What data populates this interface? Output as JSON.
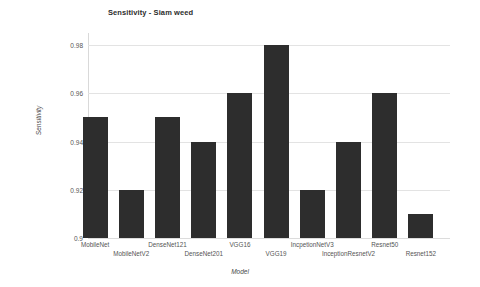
{
  "chart_data": {
    "type": "bar",
    "title": "Sensitivity - Siam weed",
    "xlabel": "Model",
    "ylabel": "Sensitivity",
    "categories": [
      "MobileNet",
      "MobileNetV2",
      "DenseNet121",
      "DenseNet201",
      "VGG16",
      "VGG19",
      "IncpetionNetV3",
      "InceptionResnetV2",
      "Resnet50",
      "Resnet152"
    ],
    "values": [
      0.95,
      0.92,
      0.95,
      0.94,
      0.96,
      0.98,
      0.92,
      0.94,
      0.96,
      0.91
    ],
    "ylim": [
      0.9,
      0.985
    ],
    "yticks": [
      0.9,
      0.92,
      0.94,
      0.96,
      0.98
    ],
    "ytick_labels": [
      "0.9",
      "0.92",
      "0.94",
      "0.96",
      "0.98"
    ],
    "grid": true,
    "legend": false,
    "bar_color": "#2d2d2d",
    "grid_color": "#e3e3e3",
    "background_color": "#ffffff"
  }
}
